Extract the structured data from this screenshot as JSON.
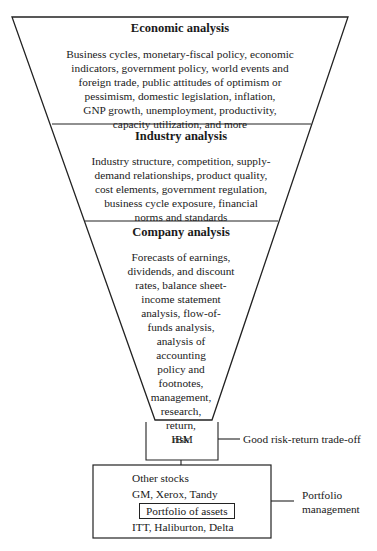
{
  "funnel": {
    "sections": [
      {
        "title": "Economic analysis",
        "lines": [
          "Business cycles, monetary-fiscal policy, economic",
          "indicators, government policy, world events and",
          "foreign trade, public attitudes of optimism or",
          "pessimism, domestic legislation, inflation,",
          "GNP growth, unemployment, productivity,",
          "capacity utilization, and more"
        ]
      },
      {
        "title": "Industry analysis",
        "lines": [
          "Industry structure, competition, supply-",
          "demand relationships, product quality,",
          "cost elements, government regulation,",
          "business cycle exposure, financial",
          "norms and standards"
        ]
      },
      {
        "title": "Company analysis",
        "lines": [
          "Forecasts of earnings,",
          "dividends, and discount",
          "rates, balance sheet-",
          "income statement",
          "analysis, flow-of-",
          "funds analysis,",
          "analysis of",
          "accounting",
          "policy and",
          "footnotes,",
          "management,",
          "research,",
          "return,",
          "risk"
        ]
      }
    ]
  },
  "selection": {
    "stock": "IBM",
    "annotation": "Good risk-return trade-off"
  },
  "portfolio": {
    "lines": [
      "Other stocks",
      "GM, Xerox, Tandy"
    ],
    "boxed_label": "Portfolio of assets",
    "last_line": "ITT, Haliburton, Delta",
    "annotation_line1": "Portfolio",
    "annotation_line2": "management"
  }
}
